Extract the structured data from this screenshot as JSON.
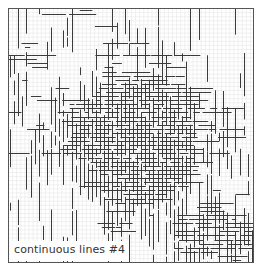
{
  "artwork": {
    "title": "continuous lines #4",
    "frame": {
      "x": 8,
      "y": 8,
      "w": 245,
      "h": 254,
      "color": "#555555"
    },
    "grid": {
      "step": 4.1,
      "color": "#e6e6e6"
    },
    "line_color": "#3a3a3a",
    "dense_regions": [
      {
        "shape": "circle",
        "cx": 128,
        "cy": 138,
        "r": 70,
        "density": 1.0
      },
      {
        "shape": "ellipse",
        "cx": 205,
        "cy": 232,
        "rx": 48,
        "ry": 30,
        "density": 0.85
      },
      {
        "shape": "ellipse",
        "cx": 18,
        "cy": 60,
        "rx": 10,
        "ry": 30,
        "density": 0.75
      }
    ],
    "light_regions": [
      {
        "cx": 55,
        "cy": 40,
        "rx": 30,
        "ry": 25
      },
      {
        "cx": 230,
        "cy": 55,
        "rx": 30,
        "ry": 45
      },
      {
        "cx": 55,
        "cy": 195,
        "rx": 45,
        "ry": 40
      },
      {
        "cx": 150,
        "cy": 235,
        "rx": 20,
        "ry": 20
      }
    ]
  }
}
